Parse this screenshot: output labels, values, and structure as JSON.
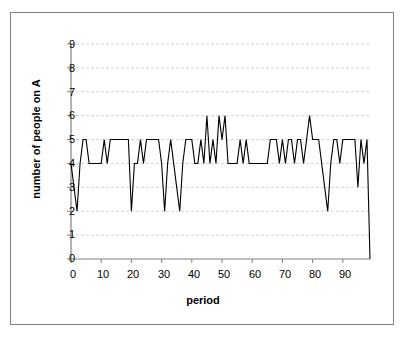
{
  "chart_data": {
    "type": "line",
    "title": "",
    "xlabel": "period",
    "ylabel": "number of people on A",
    "xlim": [
      0,
      99
    ],
    "ylim": [
      0,
      9
    ],
    "xticks": [
      0,
      10,
      20,
      30,
      40,
      50,
      60,
      70,
      80,
      90
    ],
    "yticks": [
      0,
      1,
      2,
      3,
      4,
      5,
      6,
      7,
      8,
      9
    ],
    "grid": "horizontal-dashed",
    "legend": "none",
    "line_color": "#000000",
    "grid_color": "#c8c8c8",
    "axis_color": "#808080",
    "series": [
      {
        "name": "number of people on A",
        "x": [
          0,
          1,
          2,
          3,
          4,
          5,
          6,
          7,
          8,
          9,
          10,
          11,
          12,
          13,
          14,
          15,
          16,
          17,
          18,
          19,
          20,
          21,
          22,
          23,
          24,
          25,
          26,
          27,
          28,
          29,
          30,
          31,
          32,
          33,
          34,
          35,
          36,
          37,
          38,
          39,
          40,
          41,
          42,
          43,
          44,
          45,
          46,
          47,
          48,
          49,
          50,
          51,
          52,
          53,
          54,
          55,
          56,
          57,
          58,
          59,
          60,
          61,
          62,
          63,
          64,
          65,
          66,
          67,
          68,
          69,
          70,
          71,
          72,
          73,
          74,
          75,
          76,
          77,
          78,
          79,
          80,
          81,
          82,
          83,
          84,
          85,
          86,
          87,
          88,
          89,
          90,
          91,
          92,
          93,
          94,
          95,
          96,
          97,
          98,
          99
        ],
        "values": [
          4,
          3,
          2,
          4,
          5,
          5,
          4,
          4,
          4,
          4,
          4,
          5,
          4,
          5,
          5,
          5,
          5,
          5,
          5,
          5,
          2,
          4,
          4,
          5,
          4,
          5,
          5,
          5,
          5,
          5,
          4,
          2,
          4,
          5,
          4,
          3,
          2,
          4,
          5,
          5,
          5,
          4,
          4,
          5,
          4,
          6,
          4,
          5,
          4,
          6,
          5,
          6,
          4,
          4,
          4,
          4,
          5,
          4,
          5,
          4,
          4,
          4,
          4,
          4,
          4,
          4,
          5,
          5,
          5,
          4,
          5,
          4,
          5,
          5,
          4,
          5,
          5,
          4,
          5,
          6,
          5,
          5,
          5,
          4,
          3,
          2,
          4,
          5,
          5,
          4,
          5,
          5,
          5,
          5,
          5,
          3,
          5,
          4,
          5,
          0
        ]
      }
    ]
  },
  "axis": {
    "y_title": "number of people on A",
    "x_title": "period",
    "y_tick_labels": [
      "9",
      "8",
      "7",
      "6",
      "5",
      "4",
      "3",
      "2",
      "1",
      "0"
    ],
    "x_tick_labels": [
      "0",
      "10",
      "20",
      "30",
      "40",
      "50",
      "60",
      "70",
      "80",
      "90"
    ]
  }
}
